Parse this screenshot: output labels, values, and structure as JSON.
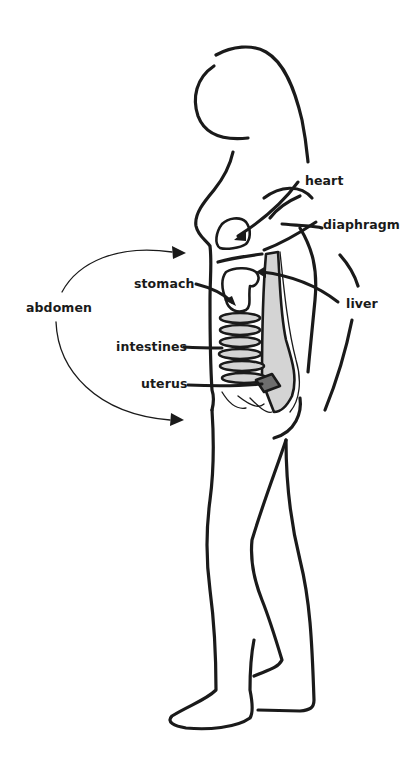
{
  "figure": {
    "colors": {
      "line": "#1a1a1a",
      "background": "#ffffff",
      "organ_fill_light": "#d4d4d4",
      "organ_fill_dark": "#6e6e6e"
    }
  },
  "labels": {
    "heart": "heart",
    "diaphragm": "diaphragm",
    "stomach": "stomach",
    "liver": "liver",
    "abdomen": "abdomen",
    "intestines": "intestines",
    "uterus": "uterus"
  }
}
